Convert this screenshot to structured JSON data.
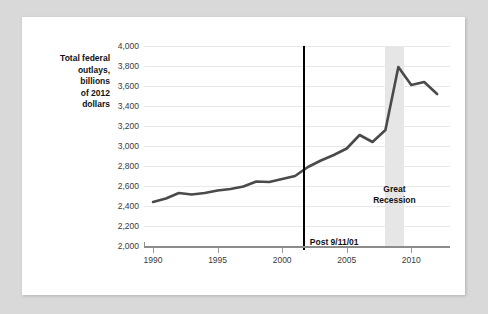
{
  "figure": {
    "background_color": "#d9d9d9",
    "card_color": "#ffffff",
    "axis_title": "Total federal\noutlays,\nbillions\nof 2012\ndollars"
  },
  "chart_data": {
    "type": "line",
    "title": "",
    "subtitle": "",
    "xlabel": "",
    "ylabel": "Total federal outlays, billions of 2012 dollars",
    "xlim": [
      1989.3,
      1989.3
    ],
    "ylim": [
      2000,
      4000
    ],
    "ytick_values": [
      2000,
      2200,
      2400,
      2600,
      2800,
      3000,
      3200,
      3400,
      3600,
      3800,
      4000
    ],
    "ytick_labels": [
      "2,000",
      "2,200",
      "2,400",
      "2,600",
      "2,800",
      "3,000",
      "3,200",
      "3,400",
      "3,600",
      "3,800",
      "4,000"
    ],
    "xtick_values": [
      1990,
      1995,
      2000,
      2005,
      2010
    ],
    "xtick_labels": [
      "1990",
      "1995",
      "2000",
      "2005",
      "2010"
    ],
    "x_axis_min": 1989.3,
    "x_axis_max": 2013.0,
    "grid": true,
    "legend": "none",
    "series": [
      {
        "name": "Total federal outlays",
        "color": "#4a4a4a",
        "line_width": 2.6,
        "x": [
          1990,
          1991,
          1992,
          1993,
          1994,
          1995,
          1996,
          1997,
          1998,
          1999,
          2000,
          2001,
          2002,
          2003,
          2004,
          2005,
          2006,
          2007,
          2008,
          2009,
          2010,
          2011,
          2012
        ],
        "values": [
          2440,
          2475,
          2530,
          2515,
          2530,
          2555,
          2570,
          2595,
          2645,
          2640,
          2670,
          2700,
          2790,
          2855,
          2910,
          2975,
          3110,
          3040,
          3160,
          3790,
          3610,
          3640,
          3520
        ]
      }
    ],
    "annotations": [
      {
        "name": "event-marker",
        "label": "Post 9/11/01",
        "x": 2001.6,
        "type": "vertical-line",
        "color": "#000000"
      },
      {
        "name": "recession-band",
        "label": "Great\nRecession",
        "x_start": 2007.95,
        "x_end": 2009.45,
        "type": "span",
        "color": "#e6e6e6"
      }
    ]
  }
}
